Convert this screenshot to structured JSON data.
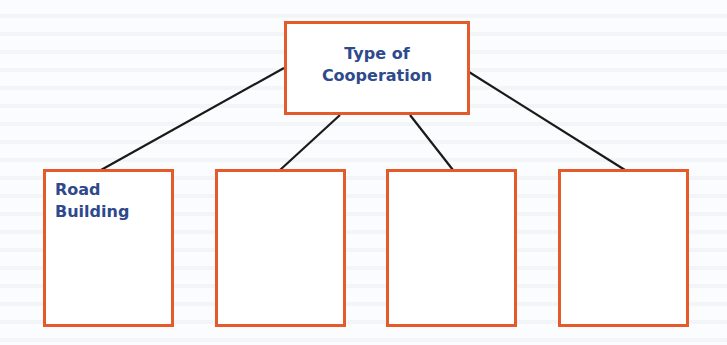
{
  "diagram": {
    "type": "tree",
    "root": {
      "label_line1": "Type of",
      "label_line2": "Cooperation"
    },
    "children": [
      {
        "label_line1": "Road",
        "label_line2": "Building"
      },
      {
        "label_line1": "",
        "label_line2": ""
      },
      {
        "label_line1": "",
        "label_line2": ""
      },
      {
        "label_line1": "",
        "label_line2": ""
      }
    ],
    "colors": {
      "box_border": "#e55a2b",
      "text": "#2e4a8c",
      "connector": "#1a1a1a"
    }
  }
}
